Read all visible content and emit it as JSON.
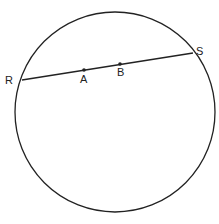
{
  "diagram": {
    "type": "circle-with-chord",
    "circle": {
      "cx": 115,
      "cy": 112,
      "r": 100,
      "stroke": "#222222"
    },
    "chord": {
      "from": "R",
      "to": "S"
    },
    "points": {
      "R": {
        "label": "R",
        "x": 22,
        "y": 80,
        "lx": 5,
        "ly": 84
      },
      "S": {
        "label": "S",
        "x": 193,
        "y": 53,
        "lx": 196,
        "ly": 55
      },
      "A": {
        "label": "A",
        "x": 84,
        "y": 70,
        "lx": 80,
        "ly": 83
      },
      "B": {
        "label": "B",
        "x": 120,
        "y": 64,
        "lx": 117,
        "ly": 76
      }
    }
  }
}
